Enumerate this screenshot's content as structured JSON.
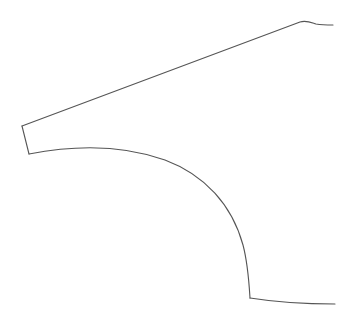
{
  "figure": {
    "stroke_color": "#555555",
    "background_color": "#ffffff",
    "paths": {
      "top_edge": "M22,126 L300,22 C306,20 310,22 316,24 C322,25 328,25 333,25",
      "front_edge": "M22,126 L29,154",
      "wheel_arch": "M29,154 C70,146 120,144 165,160 C205,175 232,205 243,245 C248,264 249,282 250,298",
      "bottom_edge": "M250,298 C275,302 305,304 335,304"
    }
  }
}
